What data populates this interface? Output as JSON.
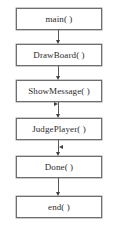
{
  "diagram": {
    "type": "flowchart",
    "title": "",
    "nodes": [
      {
        "id": "main",
        "label": "main( )",
        "x": 16,
        "y": 8,
        "w": 86,
        "h": 22
      },
      {
        "id": "drawboard",
        "label": "DrawBoard( )",
        "x": 16,
        "y": 44,
        "w": 86,
        "h": 22
      },
      {
        "id": "showmessage",
        "label": "ShowMessage( )",
        "x": 16,
        "y": 80,
        "w": 86,
        "h": 22
      },
      {
        "id": "judgeplayer",
        "label": "JudgePlayer( )",
        "x": 16,
        "y": 118,
        "w": 86,
        "h": 22
      },
      {
        "id": "done",
        "label": "Done( )",
        "x": 16,
        "y": 156,
        "w": 86,
        "h": 22
      },
      {
        "id": "end",
        "label": "end( )",
        "x": 16,
        "y": 196,
        "w": 86,
        "h": 22
      }
    ],
    "edges": [
      {
        "from": "main",
        "to": "drawboard",
        "kind": "straight-down"
      },
      {
        "from": "drawboard",
        "to": "showmessage",
        "kind": "straight-down"
      },
      {
        "from": "showmessage",
        "to": "judgeplayer",
        "kind": "straight-down"
      },
      {
        "from": "judgeplayer",
        "to": "done",
        "kind": "straight-down"
      },
      {
        "from": "done",
        "to": "end",
        "kind": "straight-down"
      },
      {
        "from": "done",
        "to": "judgeplayer",
        "kind": "loop-left",
        "note": "outer feedback loop on left side"
      },
      {
        "from": "done",
        "to": "done",
        "kind": "loop-right",
        "note": "inner feedback loop on right side"
      }
    ],
    "colors": {
      "background": "#ffffff",
      "node_border": "#6e6e6e",
      "node_fill": "#ffffff",
      "edge": "#585858",
      "loop_edge": "#8a8a8a",
      "arrow": "#404040",
      "text": "#2b2b2b"
    },
    "caption": ""
  }
}
